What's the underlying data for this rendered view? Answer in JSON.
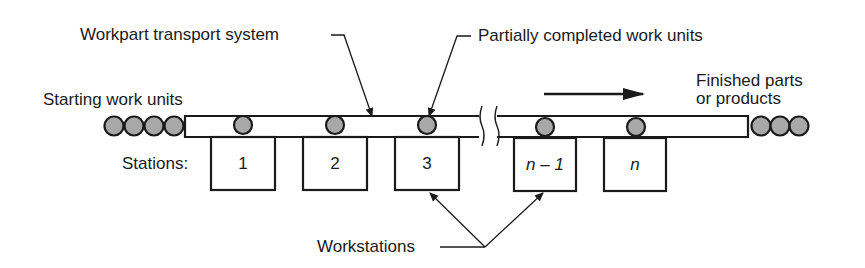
{
  "diagram": {
    "type": "flow-line production schematic",
    "labels": {
      "transport_system": "Workpart transport system",
      "partial_units": "Partially completed work units",
      "starting_units": "Starting work units",
      "finished_line1": "Finished parts",
      "finished_line2": "or products",
      "stations_prefix": "Stations:",
      "workstations": "Workstations"
    },
    "stations": [
      {
        "label": "1",
        "italic": false
      },
      {
        "label": "2",
        "italic": false
      },
      {
        "label": "3",
        "italic": false
      },
      {
        "label": "n – 1",
        "italic": true
      },
      {
        "label": "n",
        "italic": true
      }
    ],
    "flow_direction": "left-to-right",
    "starting_unit_count": 4,
    "finished_unit_count": 3,
    "work_units_on_line": 5,
    "colors": {
      "line": "#1a1a1a",
      "work_unit_fill": "#a8a8a8",
      "background": "#ffffff"
    }
  }
}
